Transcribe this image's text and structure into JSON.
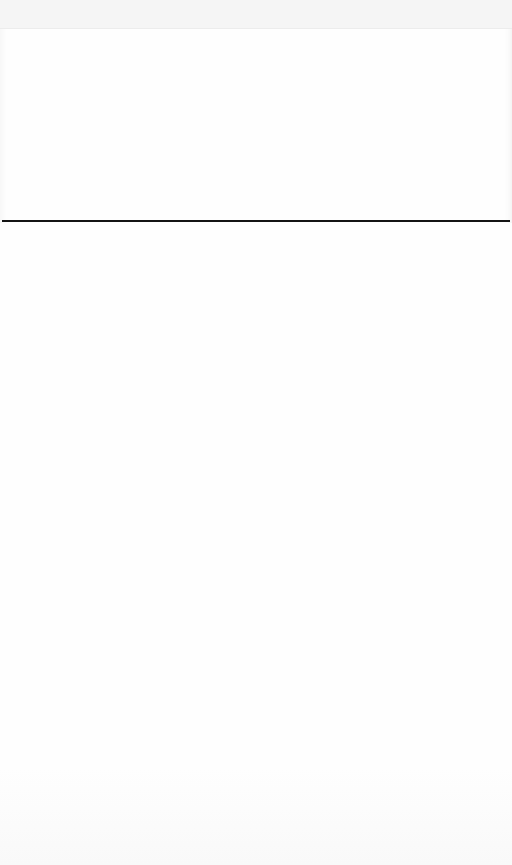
{
  "page": {
    "background_color": "#fefefe",
    "header_band_color": "#f5f5f5",
    "divider_color": "#141414"
  },
  "header": {},
  "upper_section": {},
  "lower_section": {}
}
